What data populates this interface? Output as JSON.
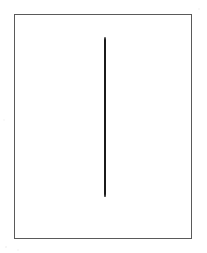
{
  "figure": {
    "kind": "line-drawing",
    "caption": "",
    "background_color": "#ffffff",
    "frame": {
      "name": "rectangular-border",
      "stroke_color": "#5a5a5a",
      "stroke_width_px": 1.4,
      "x_px": 14,
      "y_px": 14,
      "width_px": 178,
      "height_px": 225,
      "fill_color": "#ffffff"
    },
    "strokes": [
      {
        "name": "vertical-line",
        "orientation": "vertical",
        "color": "#1b1b1b",
        "thickness_px": 2.4,
        "x_px": 104,
        "top_y_px": 37,
        "bottom_y_px": 197,
        "length_px": 160
      }
    ]
  }
}
